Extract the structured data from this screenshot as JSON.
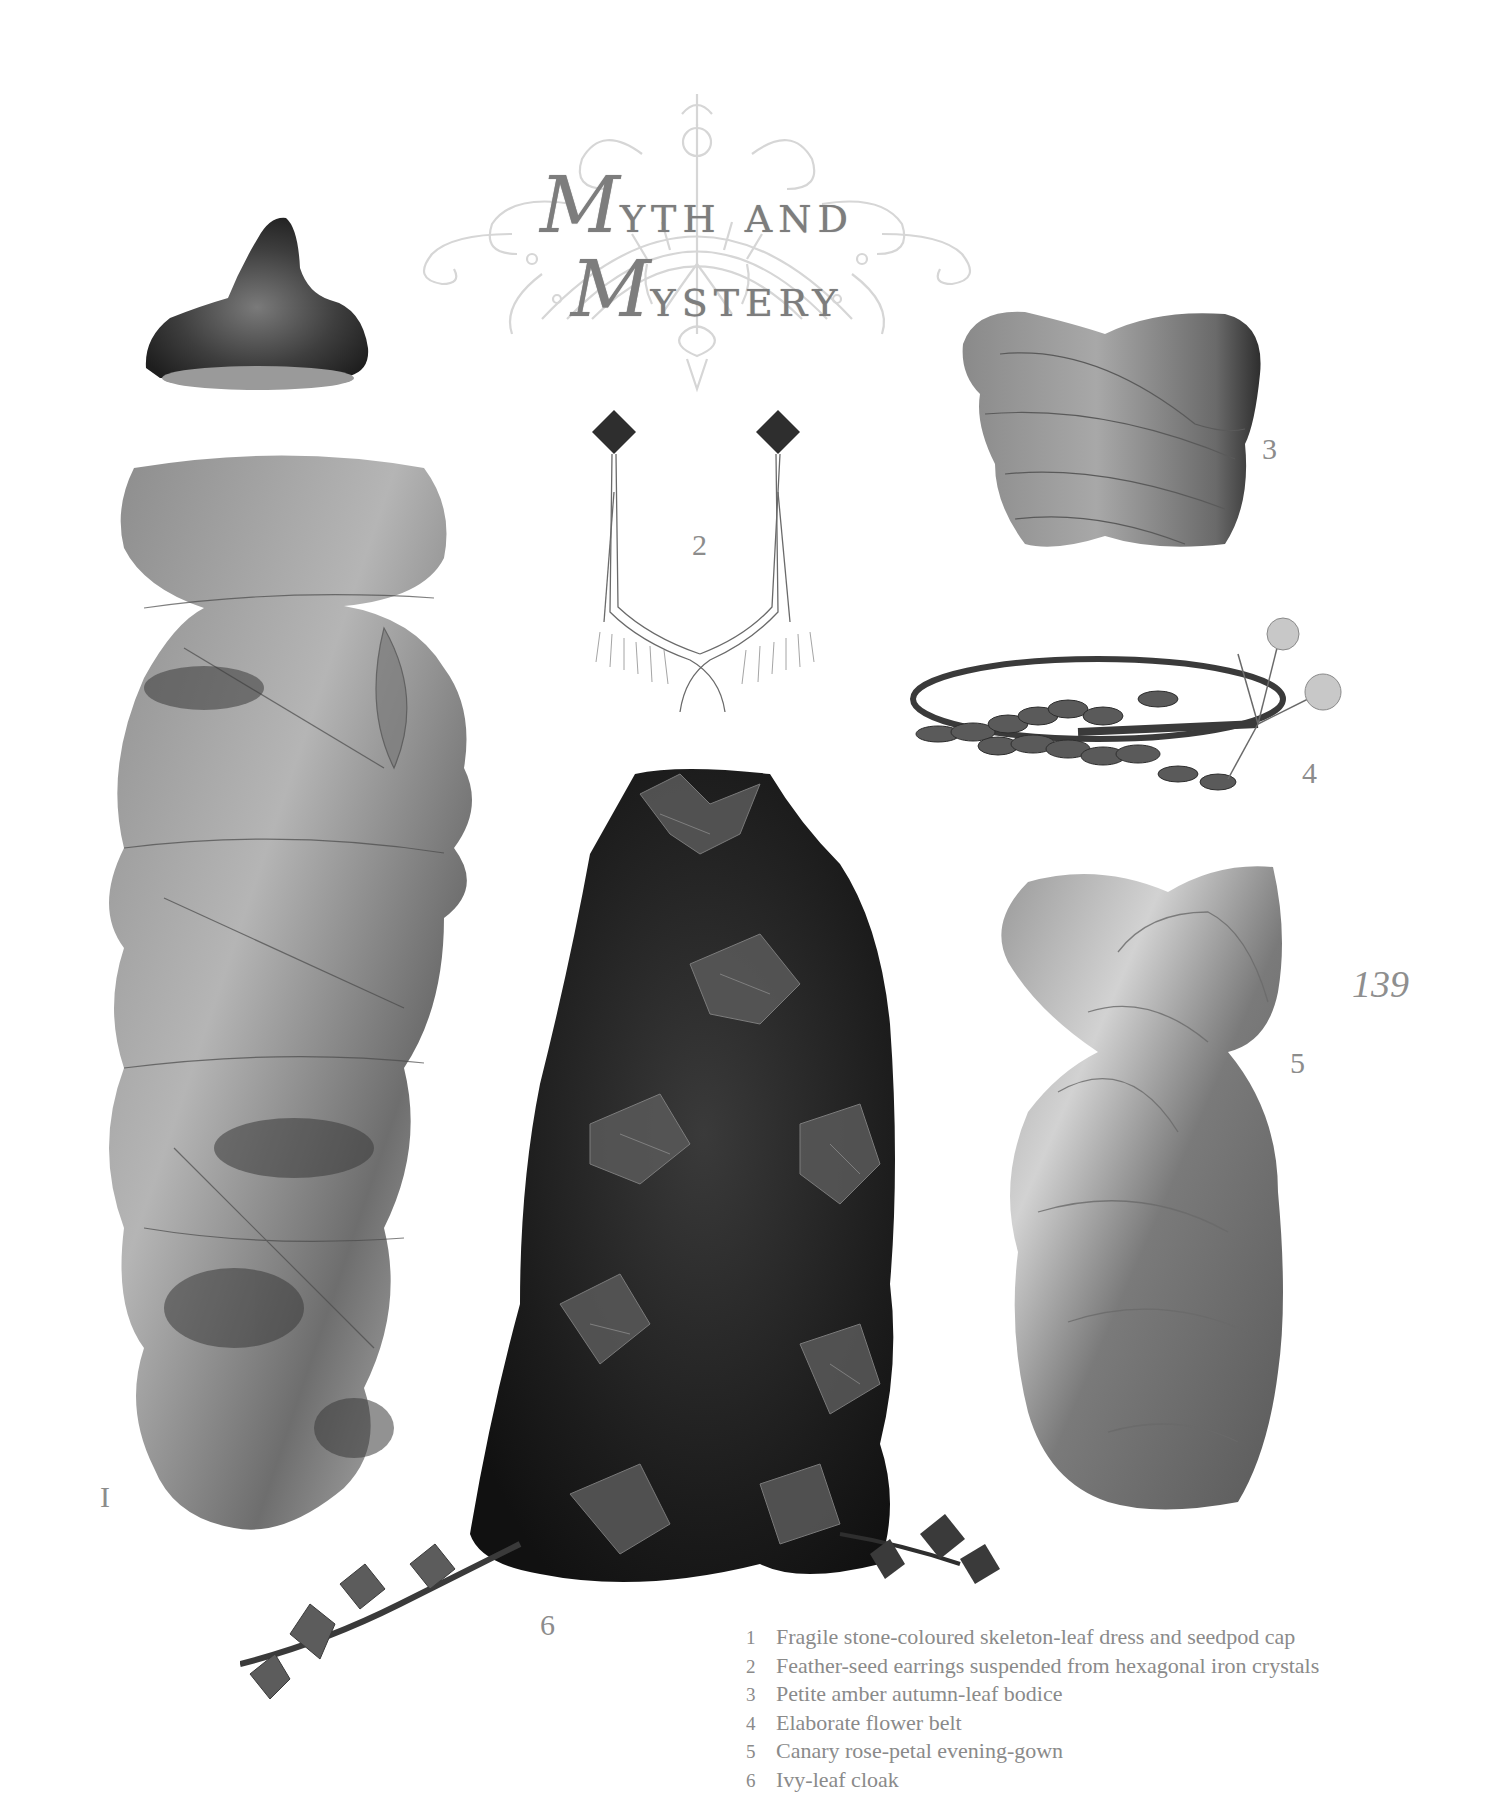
{
  "title": {
    "line1_cap": "M",
    "line1_rest": "yth and",
    "line2_cap": "M",
    "line2_rest": "ystery"
  },
  "page_number": "139",
  "items": [
    {
      "number": "1",
      "label": "I",
      "figure": "skeleton-leaf dress and seedpod cap"
    },
    {
      "number": "2",
      "label": "2",
      "figure": "feather-seed earrings"
    },
    {
      "number": "3",
      "label": "3",
      "figure": "autumn-leaf bodice"
    },
    {
      "number": "4",
      "label": "4",
      "figure": "flower belt"
    },
    {
      "number": "5",
      "label": "5",
      "figure": "rose-petal evening-gown"
    },
    {
      "number": "6",
      "label": "6",
      "figure": "ivy-leaf cloak"
    }
  ],
  "captions": [
    {
      "num": "1",
      "text": "Fragile stone-coloured skeleton-leaf dress and seedpod cap"
    },
    {
      "num": "2",
      "text": "Feather-seed earrings suspended from hexagonal iron crystals"
    },
    {
      "num": "3",
      "text": "Petite amber autumn-leaf bodice"
    },
    {
      "num": "4",
      "text": "Elaborate flower belt"
    },
    {
      "num": "5",
      "text": "Canary rose-petal evening-gown"
    },
    {
      "num": "6",
      "text": "Ivy-leaf cloak"
    }
  ],
  "colors": {
    "background": "#ffffff",
    "text_grey": "#8a8a8a",
    "title_grey": "#7d7d7d",
    "ornament_grey": "#d4d4d4"
  }
}
